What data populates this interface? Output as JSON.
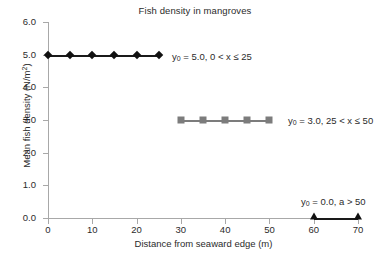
{
  "chart_data": {
    "type": "line",
    "title": "Fish density in mangroves",
    "xlabel": "Distance from seaward edge (m)",
    "ylabel": "Mean fish density (N/m2)",
    "ylabel_prefix": "Mean fish density (N/m",
    "ylabel_sup": "2",
    "ylabel_suffix": ")",
    "xlim": [
      0,
      70
    ],
    "ylim": [
      0,
      6
    ],
    "xticks": [
      0,
      10,
      20,
      30,
      40,
      50,
      60,
      70
    ],
    "xtick_labels": [
      "0",
      "10",
      "20",
      "30",
      "40",
      "50",
      "60",
      "70"
    ],
    "yticks": [
      0,
      1,
      2,
      3,
      4,
      5,
      6
    ],
    "ytick_labels": [
      "0.0",
      "1.0",
      "2.0",
      "3.0",
      "4.0",
      "5.0",
      "6.0"
    ],
    "grid": false,
    "legend": "none",
    "series": [
      {
        "name": "segment-1",
        "marker": "diamond",
        "color": "#111111",
        "line_color": "#1a1a1a",
        "x": [
          0,
          5,
          10,
          15,
          20,
          25
        ],
        "values": [
          5.0,
          5.0,
          5.0,
          5.0,
          5.0,
          5.0
        ]
      },
      {
        "name": "segment-2",
        "marker": "square",
        "color": "#7c7c7c",
        "line_color": "#7c7c7c",
        "x": [
          30,
          35,
          40,
          45,
          50
        ],
        "values": [
          3.0,
          3.0,
          3.0,
          3.0,
          3.0
        ]
      },
      {
        "name": "segment-3",
        "marker": "triangle",
        "color": "#111111",
        "line_color": "#1a1a1a",
        "x": [
          60,
          70
        ],
        "values": [
          0.0,
          0.0
        ]
      }
    ],
    "annotations": [
      {
        "name": "annotation-segment-1",
        "symbol": "y",
        "subscript": "0",
        "text": " = 5.0, 0 < x ≤ 25",
        "x_px": 172,
        "y_px": 51
      },
      {
        "name": "annotation-segment-2",
        "symbol": "y",
        "subscript": "0",
        "text": " = 3.0, 25 < x ≤ 50",
        "x_px": 288,
        "y_px": 115
      },
      {
        "name": "annotation-segment-3",
        "symbol": "y",
        "subscript": "0",
        "text": " = 0.0, a > 50",
        "x_px": 301,
        "y_px": 196
      }
    ]
  },
  "colors": {
    "axis": "#a8a8a8",
    "text": "#2b2b2b",
    "series_dark": "#111111",
    "series_gray": "#7c7c7c",
    "background": "#ffffff"
  }
}
